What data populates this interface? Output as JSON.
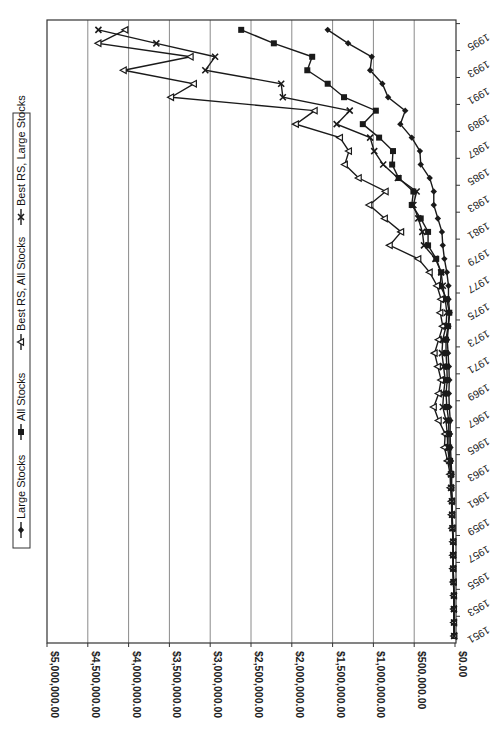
{
  "chart_data": {
    "type": "line",
    "orientation": "rotated-90-clockwise",
    "title": "",
    "xlabel": "",
    "ylabel": "",
    "ylim": [
      0,
      5000000
    ],
    "grid": true,
    "legend_position": "left (top when rotated upright)",
    "y_ticks": [
      "$0.00",
      "$500,000.00",
      "$1,000,000.00",
      "$1,500,000.00",
      "$2,000,000.00",
      "$2,500,000.00",
      "$3,000,000.00",
      "$3,500,000.00",
      "$4,000,000.00",
      "$4,500,000.00",
      "$5,000,000.00"
    ],
    "x_tick_labels": [
      "1951",
      "1953",
      "1955",
      "1957",
      "1959",
      "1961",
      "1963",
      "1965",
      "1967",
      "1969",
      "1971",
      "1973",
      "1975",
      "1977",
      "1979",
      "1981",
      "1983",
      "1985",
      "1987",
      "1989",
      "1991",
      "1993",
      "1995"
    ],
    "x": [
      1951,
      1952,
      1953,
      1954,
      1955,
      1956,
      1957,
      1958,
      1959,
      1960,
      1961,
      1962,
      1963,
      1964,
      1965,
      1966,
      1967,
      1968,
      1969,
      1970,
      1971,
      1972,
      1973,
      1974,
      1975,
      1976,
      1977,
      1978,
      1979,
      1980,
      1981,
      1982,
      1983,
      1984,
      1985,
      1986,
      1987,
      1988,
      1989,
      1990,
      1991,
      1992,
      1993,
      1994,
      1995,
      1996
    ],
    "series": [
      {
        "name": "Large Stocks",
        "marker": "diamond",
        "values": [
          10000,
          12000,
          13000,
          13000,
          18000,
          22000,
          23000,
          22000,
          30000,
          34000,
          35000,
          42000,
          40000,
          48000,
          55000,
          60000,
          58000,
          70000,
          75000,
          70000,
          75000,
          85000,
          95000,
          80000,
          65000,
          80000,
          80000,
          100000,
          130000,
          150000,
          160000,
          210000,
          260000,
          260000,
          310000,
          420000,
          430000,
          530000,
          670000,
          610000,
          820000,
          890000,
          1040000,
          1020000,
          1310000,
          1560000
        ]
      },
      {
        "name": "All Stocks",
        "marker": "square",
        "values": [
          10000,
          12000,
          13000,
          13000,
          18000,
          21000,
          22000,
          21000,
          30000,
          34000,
          35000,
          44000,
          45000,
          60000,
          72000,
          75000,
          78000,
          100000,
          110000,
          95000,
          100000,
          110000,
          110000,
          85000,
          70000,
          100000,
          180000,
          170000,
          230000,
          330000,
          330000,
          420000,
          530000,
          510000,
          690000,
          770000,
          760000,
          930000,
          1130000,
          970000,
          1360000,
          1560000,
          1810000,
          1750000,
          2220000,
          2620000
        ]
      },
      {
        "name": "Best RS, All Stocks",
        "marker": "triangle",
        "values": [
          10000,
          12000,
          13000,
          13000,
          19000,
          23000,
          24000,
          23000,
          33000,
          40000,
          42000,
          55000,
          60000,
          90000,
          130000,
          120000,
          200000,
          260000,
          200000,
          170000,
          210000,
          250000,
          200000,
          150000,
          180000,
          170000,
          220000,
          310000,
          450000,
          800000,
          660000,
          860000,
          1050000,
          850000,
          1180000,
          1350000,
          1300000,
          1410000,
          1950000,
          1720000,
          3480000,
          3200000,
          4060000,
          3240000,
          4370000,
          4040000
        ]
      },
      {
        "name": "Best RS, Large Stocks",
        "marker": "x",
        "values": [
          10000,
          12000,
          13000,
          13000,
          18000,
          22000,
          23000,
          22000,
          31000,
          36000,
          38000,
          48000,
          50000,
          70000,
          90000,
          95000,
          110000,
          150000,
          140000,
          120000,
          140000,
          160000,
          150000,
          110000,
          100000,
          120000,
          150000,
          170000,
          240000,
          380000,
          400000,
          450000,
          510000,
          470000,
          700000,
          880000,
          990000,
          1040000,
          1450000,
          1290000,
          2110000,
          2130000,
          3060000,
          2940000,
          3660000,
          4370000
        ]
      }
    ]
  },
  "legend": {
    "items": [
      {
        "label": "Large Stocks",
        "marker": "diamond"
      },
      {
        "label": "All Stocks",
        "marker": "square"
      },
      {
        "label": "Best RS, All Stocks",
        "marker": "triangle"
      },
      {
        "label": "Best RS, Large Stocks",
        "marker": "x"
      }
    ]
  },
  "style": {
    "line_color": "#1a1a1a",
    "grid_color": "#8a8a8a",
    "frame_color": "#333333",
    "background": "#ffffff"
  }
}
